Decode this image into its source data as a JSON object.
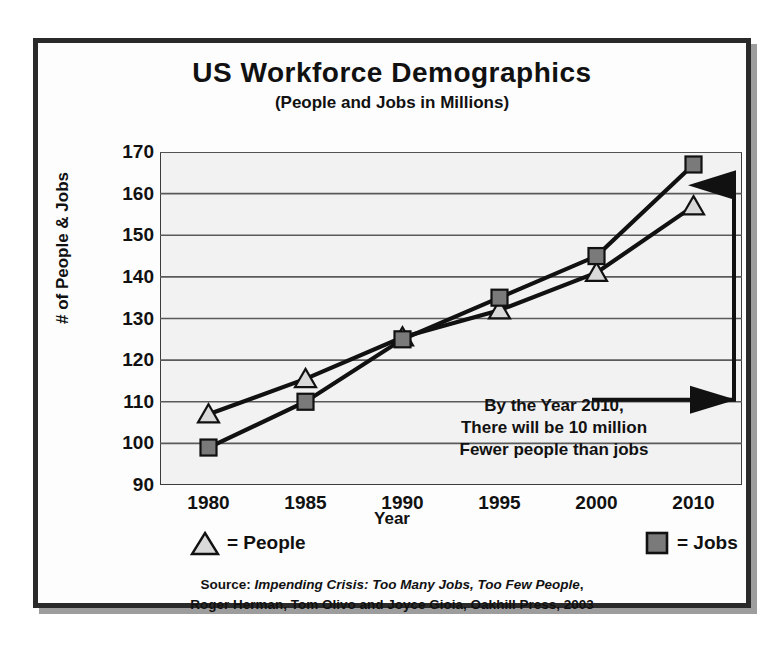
{
  "figure": {
    "title": "US Workforce Demographics",
    "subtitle": "(People and Jobs in Millions)",
    "annotation_line1": "By the Year 2010,",
    "annotation_line2": "There will be 10 million",
    "annotation_line3": "Fewer people than jobs",
    "legend_people_label": "= People",
    "legend_jobs_label": "= Jobs",
    "source_prefix": "Source:",
    "source_title": "Impending Crisis:  Too Many Jobs, Too Few People",
    "source_rest": ", Roger Herman, Tom Olivo and Joyce Gioia, Oakhill Press, 2003",
    "source_line2": "Roger Herman, Tom Olivo and Joyce Gioia, Oakhill Press, 2003",
    "colors": {
      "people_marker_fill": "#d9d9d9",
      "jobs_marker_fill": "#7a7a7a",
      "line": "#111111",
      "gridline": "#5a5a5a",
      "plot_background": "#f2f2f2",
      "frame": "#2a2a2a"
    }
  },
  "chart_data": {
    "type": "line",
    "title": "US Workforce Demographics",
    "subtitle": "(People and Jobs in Millions)",
    "xlabel": "Year",
    "ylabel": "# of People & Jobs",
    "categories": [
      "1980",
      "1985",
      "1990",
      "1995",
      "2000",
      "2010"
    ],
    "ylim": [
      90,
      170
    ],
    "ytick_labels": [
      "170",
      "160",
      "150",
      "140",
      "130",
      "120",
      "110",
      "100",
      "90"
    ],
    "yticks": [
      170,
      160,
      150,
      140,
      130,
      120,
      110,
      100,
      90
    ],
    "grid": true,
    "legend_position": "below-plot",
    "series": [
      {
        "name": "People",
        "marker": "triangle",
        "marker_fill": "#d9d9d9",
        "values": [
          107,
          115.5,
          125.5,
          132,
          141,
          157
        ]
      },
      {
        "name": "Jobs",
        "marker": "square",
        "marker_fill": "#7a7a7a",
        "values": [
          99,
          110,
          125,
          135,
          145,
          167
        ]
      }
    ],
    "annotations": [
      {
        "text": "By the Year 2010, There will be 10 million Fewer people than jobs",
        "arrow": "right-then-up-to-gap"
      }
    ]
  }
}
